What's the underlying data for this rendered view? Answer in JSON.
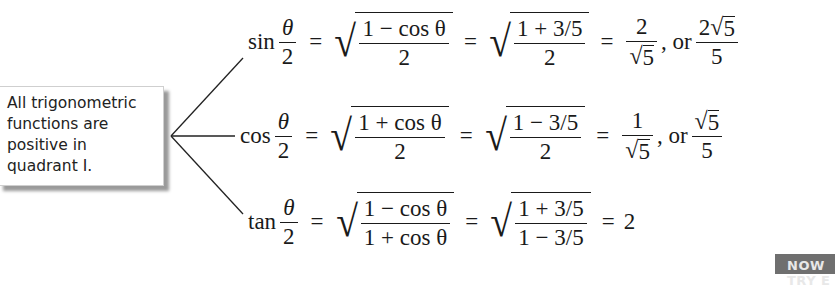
{
  "callout": {
    "lines": [
      "All trigonometric",
      "functions are",
      "positive in",
      "quadrant I."
    ]
  },
  "equations": {
    "sin": {
      "fn": "sin",
      "half_num": "θ",
      "half_den": "2",
      "step1_num": "1 − cos θ",
      "step1_den": "2",
      "step2_num": "1 + 3/5",
      "step2_den": "2",
      "result_num": "2",
      "result_den_root": "5",
      "or": ", or",
      "alt_num_coef": "2",
      "alt_num_root": "5",
      "alt_den": "5"
    },
    "cos": {
      "fn": "cos",
      "half_num": "θ",
      "half_den": "2",
      "step1_num": "1 + cos θ",
      "step1_den": "2",
      "step2_num": "1 − 3/5",
      "step2_den": "2",
      "result_num": "1",
      "result_den_root": "5",
      "or": ", or",
      "alt_num_root": "5",
      "alt_den": "5"
    },
    "tan": {
      "fn": "tan",
      "half_num": "θ",
      "half_den": "2",
      "step1_num": "1 − cos θ",
      "step1_den": "1 + cos θ",
      "step2_num": "1 + 3/5",
      "step2_den": "1 − 3/5",
      "result": "2"
    },
    "equals": "=",
    "radical": "√"
  },
  "banner": {
    "label": "NOW TRY E"
  }
}
